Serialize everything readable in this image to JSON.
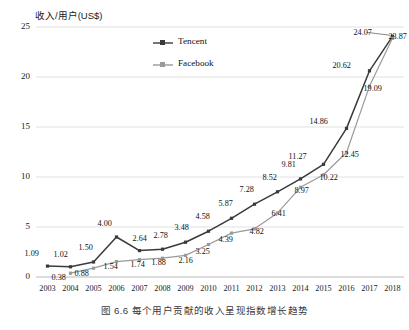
{
  "chart_data": {
    "type": "line",
    "title": "",
    "ylabel": "收入/用户(US$)",
    "xlabel": "",
    "ylim": [
      0,
      25
    ],
    "yticks": [
      "0",
      "5",
      "10",
      "15",
      "20",
      "25"
    ],
    "grid": true,
    "legend_position": "top-center",
    "categories": [
      "2003",
      "2004",
      "2005",
      "2006",
      "2007",
      "2008",
      "2009",
      "2010",
      "2011",
      "2012",
      "2013",
      "2014",
      "2015",
      "2016",
      "2017",
      "2018"
    ],
    "series": [
      {
        "name": "Tencent",
        "color": "#3a3a3a",
        "values": [
          1.09,
          1.02,
          1.5,
          4.0,
          2.64,
          2.78,
          3.48,
          4.58,
          5.87,
          7.28,
          8.52,
          9.81,
          11.27,
          14.86,
          20.62,
          24.07
        ],
        "labels": [
          "1.09",
          "1.02",
          "1.50",
          "4.00",
          "2.64",
          "2.78",
          "3.48",
          "4.58",
          "5.87",
          "7.28",
          "8.52",
          "9.81",
          "11.27",
          "14.86",
          "20.62",
          "24.07"
        ]
      },
      {
        "name": "Facebook",
        "color": "#9a9a9a",
        "values": [
          null,
          0.38,
          0.88,
          1.54,
          1.74,
          1.88,
          2.16,
          3.25,
          4.39,
          4.82,
          6.41,
          8.97,
          10.22,
          12.45,
          19.09,
          23.87
        ],
        "labels": [
          "",
          "0.38",
          "0.88",
          "1.54",
          "1.74",
          "1.88",
          "2.16",
          "3.25",
          "4.39",
          "4.82",
          "6.41",
          "8.97",
          "10.22",
          "12.45",
          "19.09",
          "23.87"
        ]
      }
    ]
  },
  "legend": {
    "items": [
      {
        "label": "Tencent",
        "color": "#3a3a3a"
      },
      {
        "label": "Facebook",
        "color": "#9a9a9a"
      }
    ]
  },
  "caption": "图 6.6    每个用户贡献的收入呈现指数增长趋势"
}
